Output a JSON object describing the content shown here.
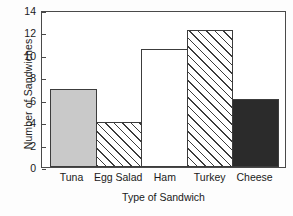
{
  "chart_data": {
    "type": "bar",
    "title": "",
    "xlabel": "Type of Sandwich",
    "ylabel": "Number of Sandwiches",
    "categories": [
      "Tuna",
      "Egg Salad",
      "Ham",
      "Turkey",
      "Cheese"
    ],
    "values": [
      7,
      4,
      10.5,
      12.2,
      6.1
    ],
    "series": [
      {
        "name": "Number of Sandwiches",
        "values": [
          7,
          4,
          10.5,
          12.2,
          6.1
        ]
      }
    ],
    "ylim": [
      0,
      14
    ],
    "yticks": [
      0,
      2,
      4,
      6,
      8,
      10,
      12,
      14
    ],
    "ytick_labels": [
      "0",
      "2",
      "4",
      "6",
      "8",
      "10",
      "12",
      "14"
    ],
    "xlim_categories": 5,
    "grid": false,
    "legend": false,
    "legend_position": "none",
    "frame": "box",
    "bar_styles": [
      {
        "category": "Tuna",
        "fill": "solid-gray",
        "color": "#c9c9c9",
        "edge": "#3c3c3c"
      },
      {
        "category": "Egg Salad",
        "fill": "hatch-45",
        "color": "#ffffff",
        "edge": "#3c3c3c"
      },
      {
        "category": "Ham",
        "fill": "empty",
        "color": "#ffffff",
        "edge": "#3c3c3c"
      },
      {
        "category": "Turkey",
        "fill": "hatch-45",
        "color": "#ffffff",
        "edge": "#3c3c3c"
      },
      {
        "category": "Cheese",
        "fill": "solid-dark",
        "color": "#2b2b2b",
        "edge": "#3c3c3c"
      }
    ]
  },
  "colors": {
    "background": "#fdfdfd",
    "plot_background": "#ffffff",
    "axis": "#4a4a4a",
    "text": "#1a1a1a"
  }
}
